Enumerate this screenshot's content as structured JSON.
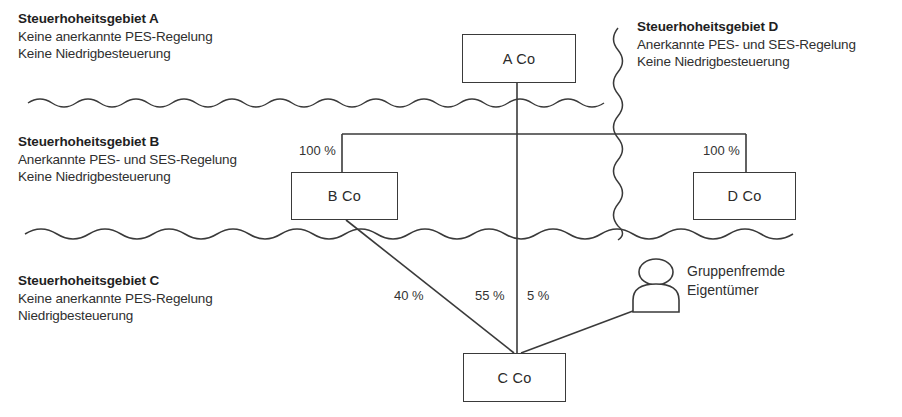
{
  "diagram": {
    "line_color": "#3a3a3a",
    "text_color": "#2b2b2b",
    "background": "#ffffff"
  },
  "regions": [
    {
      "id": "region-a",
      "title": "Steuerhoheitsgebiet A",
      "line1": "Keine anerkannte PES-Regelung",
      "line2": "Keine Niedrigbesteuerung"
    },
    {
      "id": "region-d",
      "title": "Steuerhoheitsgebiet D",
      "line1": "Anerkannte PES- und SES-Regelung",
      "line2": "Keine Niedrigbesteuerung"
    },
    {
      "id": "region-b",
      "title": "Steuerhoheitsgebiet B",
      "line1": "Anerkannte PES- und SES-Regelung",
      "line2": "Keine Niedrigbesteuerung"
    },
    {
      "id": "region-c",
      "title": "Steuerhoheitsgebiet C",
      "line1": "Keine anerkannte PES-Regelung",
      "line2": "Niedrigbesteuerung"
    }
  ],
  "entities": {
    "a_co": "A Co",
    "b_co": "B Co",
    "c_co": "C Co",
    "d_co": "D Co"
  },
  "owner": {
    "line1": "Gruppenfremde",
    "line2": "Eigentümer",
    "icon": "person-icon"
  },
  "shareholdings": {
    "a_to_b": "100 %",
    "a_to_d": "100 %",
    "b_to_c": "40 %",
    "a_to_c": "55 %",
    "owner_to_c": "5 %"
  }
}
